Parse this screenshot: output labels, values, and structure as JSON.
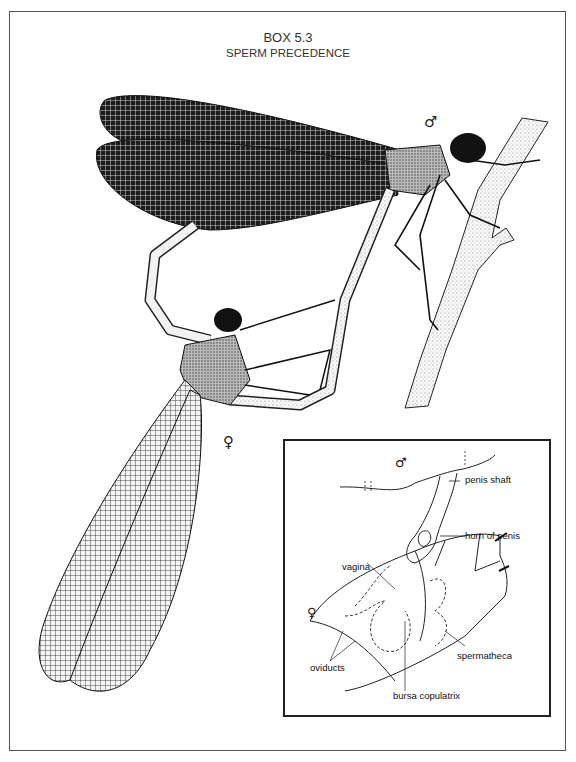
{
  "title": {
    "box_number": "BOX 5.3",
    "subtitle": "SPERM PRECEDENCE"
  },
  "main_figure": {
    "description": "Two damselflies in tandem/copulation wheel; male perched on twig, female below with wings hanging down",
    "male_symbol": "♂",
    "female_symbol": "♀"
  },
  "inset": {
    "male_symbol": "♂",
    "female_symbol": "♀",
    "labels": {
      "penis_shaft": "penis  shaft",
      "horn_of_penis": "horn of penis",
      "vagina": "vagina",
      "oviducts": "oviducts",
      "spermatheca": "spermatheca",
      "bursa_copulatrix": "bursa copulatrix"
    }
  }
}
